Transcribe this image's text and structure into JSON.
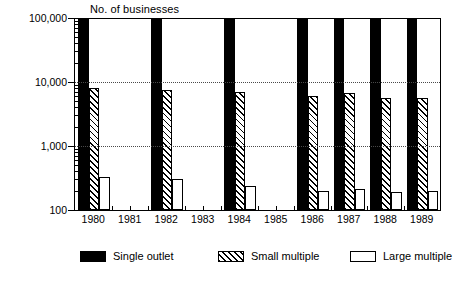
{
  "chart_data": {
    "type": "bar",
    "title": "",
    "ylabel": "No. of businesses",
    "xlabel": "",
    "yscale": "log",
    "ylim": [
      100,
      100000
    ],
    "yticks": [
      100,
      1000,
      10000,
      100000
    ],
    "ytick_labels": [
      "100",
      "1,000",
      "10,000",
      "100,000"
    ],
    "grid": "horizontal dotted at 1,000 and 10,000",
    "legend_position": "bottom",
    "categories": [
      "1980",
      "1981",
      "1982",
      "1983",
      "1984",
      "1985",
      "1986",
      "1987",
      "1988",
      "1989"
    ],
    "series": [
      {
        "name": "Single outlet",
        "pattern": "solid-black",
        "values": [
          100000,
          null,
          100000,
          null,
          100000,
          null,
          100000,
          100000,
          100000,
          100000
        ]
      },
      {
        "name": "Small multiple",
        "pattern": "diagonal-hatch",
        "values": [
          8000,
          null,
          7400,
          null,
          6900,
          null,
          6000,
          6700,
          5700,
          5600
        ]
      },
      {
        "name": "Large multiple",
        "pattern": "white-outline",
        "values": [
          330,
          null,
          300,
          null,
          240,
          null,
          200,
          215,
          190,
          195
        ]
      }
    ]
  },
  "legend": {
    "items": [
      {
        "label": "Single outlet",
        "swatch": "solid-black-swatch"
      },
      {
        "label": "Small multiple",
        "swatch": "hatched-swatch"
      },
      {
        "label": "Large multiple",
        "swatch": "white-outline-swatch"
      }
    ]
  }
}
